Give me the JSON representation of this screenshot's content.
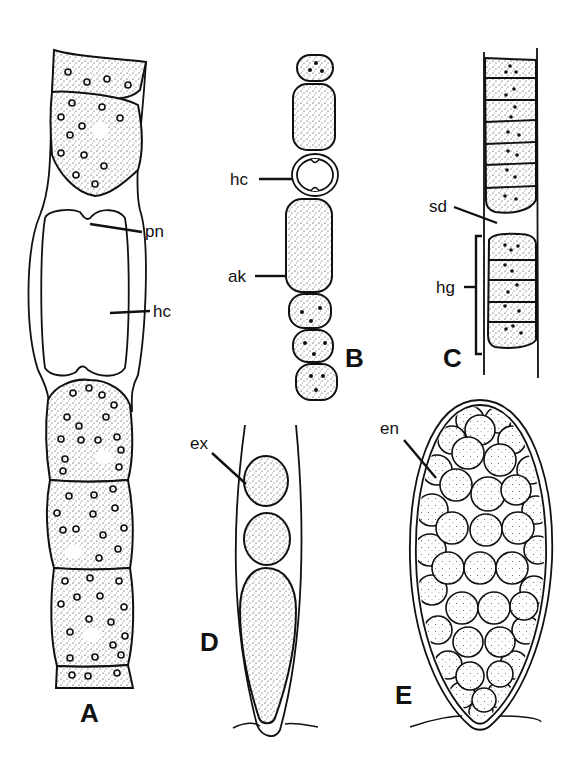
{
  "figure": {
    "panels": [
      {
        "id": "A",
        "label": "A",
        "description": "Filament with intercalary heterocyst",
        "annotations": [
          {
            "abbr": "pn",
            "meaning": "polar nodule"
          },
          {
            "abbr": "hc",
            "meaning": "heterocyst"
          }
        ]
      },
      {
        "id": "B",
        "label": "B",
        "description": "Filament with heterocyst and akinete",
        "annotations": [
          {
            "abbr": "hc",
            "meaning": "heterocyst"
          },
          {
            "abbr": "ak",
            "meaning": "akinete"
          }
        ]
      },
      {
        "id": "C",
        "label": "C",
        "description": "Filament with separation disc and hormogonium",
        "annotations": [
          {
            "abbr": "sd",
            "meaning": "separation disc"
          },
          {
            "abbr": "hg",
            "meaning": "hormogonium"
          }
        ]
      },
      {
        "id": "D",
        "label": "D",
        "description": "Cell producing exospores",
        "annotations": [
          {
            "abbr": "ex",
            "meaning": "exospore"
          }
        ]
      },
      {
        "id": "E",
        "label": "E",
        "description": "Sporangium filled with endospores",
        "annotations": [
          {
            "abbr": "en",
            "meaning": "endospore"
          }
        ]
      }
    ]
  },
  "labels": {
    "A": "A",
    "B": "B",
    "C": "C",
    "D": "D",
    "E": "E",
    "pn": "pn",
    "hcA": "hc",
    "hcB": "hc",
    "ak": "ak",
    "sd": "sd",
    "hg": "hg",
    "ex": "ex",
    "en": "en"
  },
  "colors": {
    "ink": "#111111",
    "background": "#ffffff"
  }
}
